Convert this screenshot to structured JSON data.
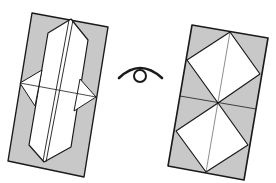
{
  "diagram": {
    "colors": {
      "paper_back": "#c8c8c8",
      "paper_front": "#ffffff",
      "line": "#1a1a1a"
    },
    "left_model": {
      "label": "Before turning over: vertical flaps folded toward center with side triangle points"
    },
    "symbol": {
      "label": "turn-over symbol (eye)"
    },
    "right_model": {
      "label": "After turning over: two diamond squares stacked vertically"
    }
  }
}
